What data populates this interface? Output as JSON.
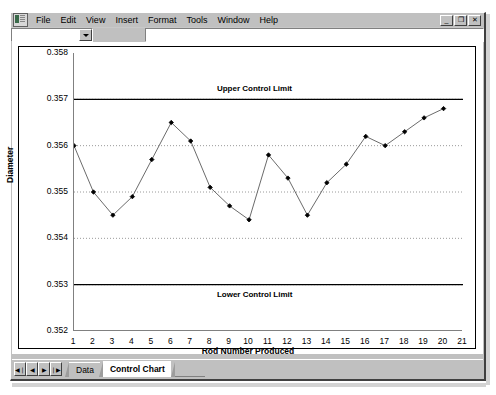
{
  "window": {
    "icon": "excel-document-icon",
    "menus": [
      {
        "label": "File",
        "accel": "F"
      },
      {
        "label": "Edit",
        "accel": "E"
      },
      {
        "label": "View",
        "accel": "V"
      },
      {
        "label": "Insert",
        "accel": "I"
      },
      {
        "label": "Format",
        "accel": "o"
      },
      {
        "label": "Tools",
        "accel": "T"
      },
      {
        "label": "Window",
        "accel": "W"
      },
      {
        "label": "Help",
        "accel": "H"
      }
    ],
    "buttons": {
      "minimize": "_",
      "restore": "❐",
      "close": "✕"
    }
  },
  "formula_bar": {
    "name_box_value": "",
    "name_box_placeholder": "",
    "dropdown_icon": "chevron-down-icon",
    "formula_value": "",
    "formula_placeholder": ""
  },
  "sheet_tabs": {
    "nav": [
      "◀❘",
      "◀",
      "▶",
      "❘▶"
    ],
    "tabs": [
      {
        "label": "Data",
        "active": false
      },
      {
        "label": "Control Chart",
        "active": true
      }
    ]
  },
  "chart_data": {
    "type": "line",
    "title": "",
    "xlabel": "Rod Number Produced",
    "ylabel": "Diameter",
    "xlim": [
      1,
      21
    ],
    "ylim": [
      0.352,
      0.358
    ],
    "xticks": [
      1,
      2,
      3,
      4,
      5,
      6,
      7,
      8,
      9,
      10,
      11,
      12,
      13,
      14,
      15,
      16,
      17,
      18,
      19,
      20,
      21
    ],
    "yticks": [
      0.352,
      0.353,
      0.354,
      0.355,
      0.356,
      0.357,
      0.358
    ],
    "ytick_labels": [
      "0.352",
      "0.353",
      "0.354",
      "0.355",
      "0.356",
      "0.357",
      "0.358"
    ],
    "grid": "horizontal-dotted",
    "legend": "none",
    "marker": "filled-diamond",
    "line_color": "#6b6b6b",
    "marker_color": "#000000",
    "x": [
      1,
      2,
      3,
      4,
      5,
      6,
      7,
      8,
      9,
      10,
      11,
      12,
      13,
      14,
      15,
      16,
      17,
      18,
      19,
      20
    ],
    "values": [
      0.356,
      0.355,
      0.3545,
      0.3549,
      0.3557,
      0.3565,
      0.3561,
      0.3551,
      0.3547,
      0.3544,
      0.3558,
      0.3553,
      0.3545,
      0.3552,
      0.3556,
      0.3562,
      0.356,
      0.3563,
      0.3566,
      0.3568
    ],
    "annotations": [
      {
        "name": "upper-control-limit",
        "label": "Upper Control Limit",
        "y": 0.357,
        "line": "solid",
        "color": "#000000"
      },
      {
        "name": "lower-control-limit",
        "label": "Lower Control Limit",
        "y": 0.353,
        "line": "solid",
        "color": "#000000"
      }
    ]
  }
}
